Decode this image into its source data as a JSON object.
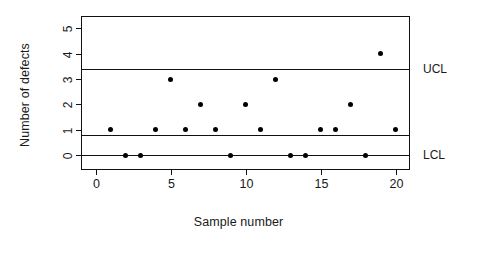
{
  "chart_data": {
    "type": "scatter",
    "title": "",
    "xlabel": "Sample number",
    "ylabel": "Number of defects",
    "x": [
      1,
      2,
      3,
      4,
      5,
      6,
      7,
      8,
      9,
      10,
      11,
      12,
      13,
      14,
      15,
      16,
      17,
      18,
      19,
      20
    ],
    "values": [
      1,
      0,
      0,
      1,
      3,
      1,
      2,
      1,
      0,
      2,
      1,
      3,
      0,
      0,
      1,
      1,
      2,
      0,
      4,
      1
    ],
    "xlim": [
      -0.9,
      20.9
    ],
    "ylim": [
      -0.55,
      5.45
    ],
    "xticks": [
      0,
      5,
      10,
      15,
      20
    ],
    "xtick_labels": [
      "0",
      "5",
      "10",
      "15",
      "20"
    ],
    "yticks": [
      0,
      1,
      2,
      3,
      4,
      5
    ],
    "ytick_labels": [
      "0",
      "1",
      "2",
      "3",
      "4",
      "5"
    ],
    "grid": false,
    "legend": null,
    "control_lines": [
      {
        "name": "UCL",
        "label": "UCL",
        "value": 3.4
      },
      {
        "name": "CL",
        "label": "",
        "value": 0.8
      },
      {
        "name": "LCL",
        "label": "LCL",
        "value": 0.0
      }
    ],
    "marker": "filled-circle",
    "marker_color": "#000000",
    "line_color": "#111111",
    "frame_color": "#111111",
    "background": "#ffffff"
  }
}
